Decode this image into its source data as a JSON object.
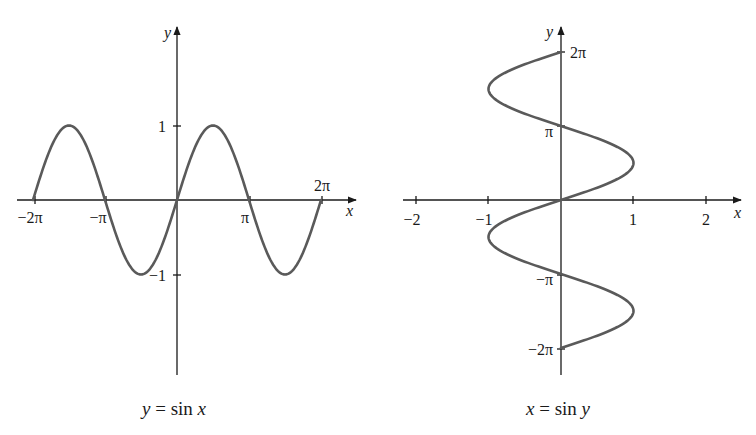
{
  "colors": {
    "axis": "#1a1a1a",
    "curve": "#5a5a5a",
    "background": "#ffffff"
  },
  "chart_data": [
    {
      "type": "line",
      "title": "y = sin x",
      "xlabel": "x",
      "ylabel": "y",
      "function": "sin",
      "xlim": [
        -6.2832,
        6.2832
      ],
      "ylim": [
        -1,
        1
      ],
      "x_ticks": [
        {
          "value": -6.2832,
          "label": "−2π"
        },
        {
          "value": -3.1416,
          "label": "−π"
        },
        {
          "value": 3.1416,
          "label": "π"
        },
        {
          "value": 6.2832,
          "label": "2π"
        }
      ],
      "y_ticks": [
        {
          "value": 1,
          "label": "1"
        },
        {
          "value": -1,
          "label": "−1"
        }
      ],
      "series": [
        {
          "name": "y = sin x",
          "x_range": [
            -6.2832,
            6.2832
          ],
          "x": [
            -6.2832,
            -4.7124,
            -3.1416,
            -1.5708,
            0,
            1.5708,
            3.1416,
            4.7124,
            6.2832
          ],
          "values": [
            0,
            1,
            0,
            -1,
            0,
            1,
            0,
            -1,
            0
          ]
        }
      ],
      "grid": false,
      "legend": "none"
    },
    {
      "type": "line",
      "title": "x = sin y",
      "xlabel": "x",
      "ylabel": "y",
      "function": "sin (inverse orientation)",
      "xlim": [
        -2,
        2
      ],
      "ylim": [
        -6.2832,
        6.2832
      ],
      "x_ticks": [
        {
          "value": -2,
          "label": "−2"
        },
        {
          "value": -1,
          "label": "−1"
        },
        {
          "value": 1,
          "label": "1"
        },
        {
          "value": 2,
          "label": "2"
        }
      ],
      "y_ticks": [
        {
          "value": 6.2832,
          "label": "2π"
        },
        {
          "value": 3.1416,
          "label": "π"
        },
        {
          "value": -3.1416,
          "label": "−π"
        },
        {
          "value": -6.2832,
          "label": "−2π"
        }
      ],
      "series": [
        {
          "name": "x = sin y",
          "y": [
            -6.2832,
            -4.7124,
            -3.1416,
            -1.5708,
            0,
            1.5708,
            3.1416,
            4.7124,
            6.2832
          ],
          "values": [
            0,
            1,
            0,
            -1,
            0,
            1,
            0,
            -1,
            0
          ]
        }
      ],
      "grid": false,
      "legend": "none"
    }
  ],
  "left": {
    "axis_x": "x",
    "axis_y": "y",
    "ticks_x": [
      "−2π",
      "−π",
      "π",
      "2π"
    ],
    "ticks_y": [
      "1",
      "−1"
    ],
    "caption": {
      "lhs": "y",
      "eq": " = sin ",
      "rhs": "x"
    }
  },
  "right": {
    "axis_x": "x",
    "axis_y": "y",
    "ticks_x": [
      "−2",
      "−1",
      "1",
      "2"
    ],
    "ticks_y": [
      "2π",
      "π",
      "−π",
      "−2π"
    ],
    "caption": {
      "lhs": "x",
      "eq": " = sin ",
      "rhs": "y"
    }
  }
}
